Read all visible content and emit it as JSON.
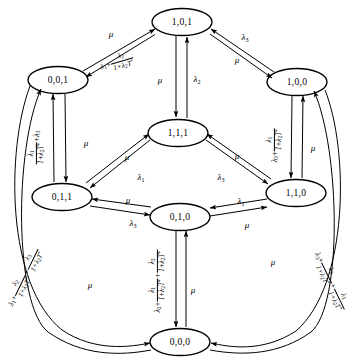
{
  "diagram": {
    "type": "markov-state-transition-diagram",
    "title": "",
    "node_shape": "ellipse",
    "stroke_color": "#000000",
    "background_color": "#ffffff",
    "nodes": [
      {
        "id": "101",
        "label": "1,0,1",
        "x": 182,
        "y": 22
      },
      {
        "id": "001",
        "label": "0,0,1",
        "x": 58,
        "y": 80
      },
      {
        "id": "100",
        "label": "1,0,0",
        "x": 297,
        "y": 82
      },
      {
        "id": "111",
        "label": "1,1,1",
        "x": 178,
        "y": 133
      },
      {
        "id": "011",
        "label": "0,1,1",
        "x": 62,
        "y": 197
      },
      {
        "id": "110",
        "label": "1,1,0",
        "x": 296,
        "y": 193
      },
      {
        "id": "010",
        "label": "0,1,0",
        "x": 180,
        "y": 217
      },
      {
        "id": "000",
        "label": "0,0,0",
        "x": 180,
        "y": 342
      }
    ],
    "edge_labels": [
      {
        "id": "mu-001-101",
        "text": "mu",
        "x": 111,
        "y": 34
      },
      {
        "id": "lam1-101-001",
        "text": "lambda_1 + lambda_2/(1+lambda_2 T*)",
        "x": 117,
        "y": 62
      },
      {
        "id": "lam3-101-100",
        "text": "lambda_3",
        "x": 245,
        "y": 38
      },
      {
        "id": "mu-100-101",
        "text": "mu",
        "x": 237,
        "y": 60
      },
      {
        "id": "mu-101-111",
        "text": "mu",
        "x": 160,
        "y": 80
      },
      {
        "id": "lam2-111-101",
        "text": "lambda_2",
        "x": 196,
        "y": 80
      },
      {
        "id": "lam13-001-011",
        "text": "lambda_1/(1+lambda_2 T*) + lambda_3",
        "x": 56,
        "y": 148
      },
      {
        "id": "mu-011-001",
        "text": "mu",
        "x": 86,
        "y": 143
      },
      {
        "id": "lam31-100-110",
        "text": "lambda_3 + lambda_1/(1+lambda_2 T*)",
        "x": 283,
        "y": 145
      },
      {
        "id": "mu-110-100",
        "text": "mu",
        "x": 312,
        "y": 148
      },
      {
        "id": "mu-111-011",
        "text": "mu",
        "x": 127,
        "y": 157
      },
      {
        "id": "lam1-011-111",
        "text": "lambda_1",
        "x": 141,
        "y": 177
      },
      {
        "id": "mu-111-110",
        "text": "mu",
        "x": 237,
        "y": 156
      },
      {
        "id": "lam3-110-111",
        "text": "lambda_3",
        "x": 222,
        "y": 177
      },
      {
        "id": "mu-010-011",
        "text": "mu",
        "x": 128,
        "y": 200
      },
      {
        "id": "lam3-011-010",
        "text": "lambda_3",
        "x": 134,
        "y": 223
      },
      {
        "id": "lam1-110-010",
        "text": "lambda_1",
        "x": 240,
        "y": 202
      },
      {
        "id": "mu-010-110",
        "text": "mu",
        "x": 247,
        "y": 224
      },
      {
        "id": "lam213-010-000",
        "text": "lambda_2 + lambda_1/(1+lambda_2 T*) + lambda_3/(1+lambda_2 T*)",
        "x": 157,
        "y": 281
      },
      {
        "id": "mu-000-010",
        "text": "mu",
        "x": 192,
        "y": 290
      },
      {
        "id": "lam123-left",
        "text": "lambda_1 + lambda_2/(1+lambda_2 T*) + lambda_3/(1+lambda_2 T*)",
        "x": 23,
        "y": 277
      },
      {
        "id": "mu-000-001",
        "text": "mu",
        "x": 90,
        "y": 285
      },
      {
        "id": "lam321-right",
        "text": "lambda_3 + lambda_2/(1+lambda_2 T*) + lambda_1/(1+lambda_2 T*)",
        "x": 331,
        "y": 281
      },
      {
        "id": "mu-000-100",
        "text": "mu",
        "x": 273,
        "y": 262
      }
    ],
    "symbols": {
      "mu": "μ",
      "lambda": "λ",
      "T_star": "T*",
      "sub1": "1",
      "sub2": "2",
      "sub3": "3",
      "one": "1",
      "plus": "+"
    }
  }
}
